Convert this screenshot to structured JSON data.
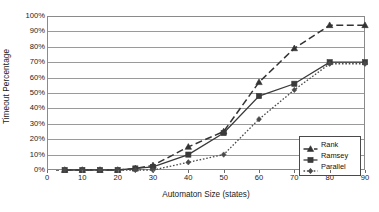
{
  "chart_data": {
    "type": "line",
    "title": "",
    "xlabel": "Automaton Size (states)",
    "ylabel": "Timeout Percentage",
    "xlim": [
      0,
      90
    ],
    "ylim": [
      0,
      100
    ],
    "grid": true,
    "legend_position": "bottom-right-inside",
    "xticks": [
      "0",
      "10",
      "20",
      "30",
      "40",
      "50",
      "60",
      "70",
      "80",
      "90"
    ],
    "xtick_values": [
      0,
      10,
      20,
      30,
      40,
      50,
      60,
      70,
      80,
      90
    ],
    "yticks": [
      "0%",
      "10%",
      "20%",
      "30%",
      "40%",
      "50%",
      "60%",
      "70%",
      "80%",
      "90%",
      "100%"
    ],
    "ytick_values": [
      0,
      10,
      20,
      30,
      40,
      50,
      60,
      70,
      80,
      90,
      100
    ],
    "series": [
      {
        "name": "Rank",
        "marker": "triangle",
        "line_style": "dashed",
        "color": "#333333",
        "x": [
          5,
          10,
          15,
          20,
          25,
          30,
          40,
          50,
          60,
          70,
          80,
          90
        ],
        "values": [
          0,
          0,
          0,
          0,
          1,
          3,
          15,
          25,
          57,
          79,
          94,
          94
        ]
      },
      {
        "name": "Ramsey",
        "marker": "square",
        "line_style": "solid",
        "color": "#3a3a3a",
        "x": [
          5,
          10,
          15,
          20,
          25,
          30,
          40,
          50,
          60,
          70,
          80,
          90
        ],
        "values": [
          0,
          0,
          0,
          0,
          1,
          2,
          10,
          24,
          48,
          56,
          70,
          70
        ]
      },
      {
        "name": "Parallel",
        "marker": "dot",
        "line_style": "dotted",
        "color": "#4a4a4a",
        "x": [
          5,
          10,
          15,
          20,
          25,
          30,
          40,
          50,
          60,
          70,
          80,
          90
        ],
        "values": [
          0,
          0,
          0,
          0,
          0,
          0,
          5,
          10,
          33,
          52,
          69,
          69
        ]
      }
    ]
  },
  "legend": {
    "items": [
      {
        "label": "Rank"
      },
      {
        "label": "Ramsey"
      },
      {
        "label": "Parallel"
      }
    ]
  }
}
